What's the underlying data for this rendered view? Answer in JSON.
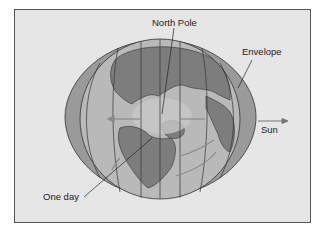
{
  "figure": {
    "labels": {
      "north_pole": "North Pole",
      "envelope": "Envelope",
      "sun": "Sun",
      "one_day": "One day"
    },
    "colors": {
      "background": "#e6e6e6",
      "frame_border": "#555555",
      "envelope": "#9a9a9a",
      "ocean": "#b9b9b9",
      "land": "#7d7d7d",
      "arctic": "#c8c8c8",
      "lines": "#333333",
      "arrows": "#8a8a8a"
    }
  }
}
